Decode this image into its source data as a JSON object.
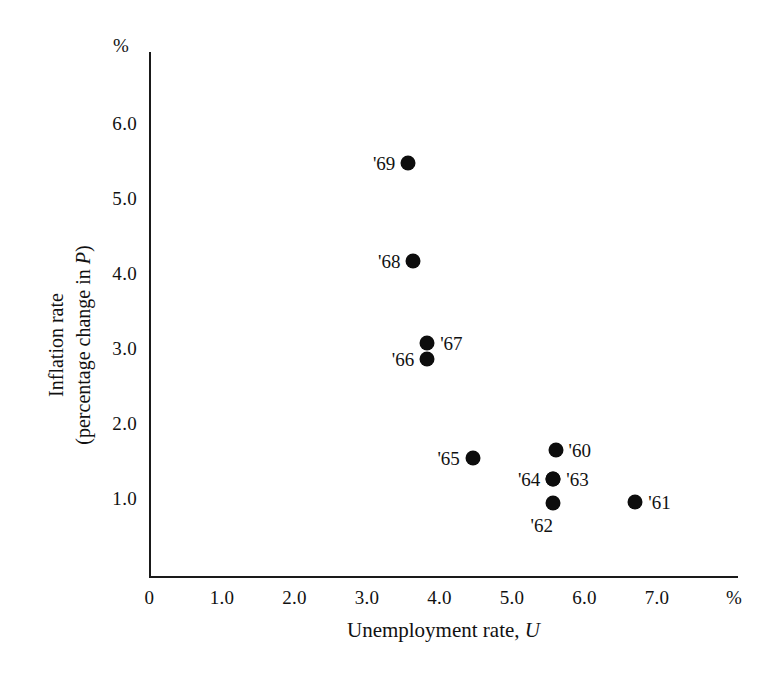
{
  "chart_data": {
    "type": "scatter",
    "title": "",
    "xlabel": "Unemployment rate, U",
    "xlabel_main": "Unemployment rate,",
    "xlabel_symbol": "U",
    "ylabel_line1": "Inflation rate",
    "ylabel_line2_main": "(percentage change in ",
    "ylabel_line2_symbol": "P",
    "ylabel_line2_end": ")",
    "x_unit": "%",
    "y_unit": "%",
    "xlim": [
      0,
      7.6
    ],
    "ylim": [
      0,
      6.8
    ],
    "xticks": [
      "0",
      "1.0",
      "2.0",
      "3.0",
      "4.0",
      "5.0",
      "6.0",
      "7.0"
    ],
    "xtick_values": [
      0,
      1,
      2,
      3,
      4,
      5,
      6,
      7
    ],
    "yticks": [
      "1.0",
      "2.0",
      "3.0",
      "4.0",
      "5.0",
      "6.0"
    ],
    "ytick_values": [
      1,
      2,
      3,
      4,
      5,
      6
    ],
    "grid": false,
    "legend": "none",
    "marker_color": "#0d0d0d",
    "axis_color": "#1a1a1a",
    "points": [
      {
        "label": "'69",
        "x": 3.57,
        "y": 5.47,
        "label_side": "left"
      },
      {
        "label": "'68",
        "x": 3.64,
        "y": 4.16,
        "label_side": "left"
      },
      {
        "label": "'67",
        "x": 3.83,
        "y": 3.07,
        "label_side": "right"
      },
      {
        "label": "'66",
        "x": 3.83,
        "y": 2.85,
        "label_side": "left"
      },
      {
        "label": "'65",
        "x": 4.46,
        "y": 1.53,
        "label_side": "left"
      },
      {
        "label": "'60",
        "x": 5.6,
        "y": 1.64,
        "label_side": "right"
      },
      {
        "label": "'63",
        "x": 5.57,
        "y": 1.25,
        "label_side": "right"
      },
      {
        "label": "'64",
        "x": 5.57,
        "y": 1.25,
        "label_side": "left"
      },
      {
        "label": "'62",
        "x": 5.56,
        "y": 0.93,
        "label_side": "below"
      },
      {
        "label": "'61",
        "x": 6.7,
        "y": 0.95,
        "label_side": "right"
      }
    ]
  }
}
